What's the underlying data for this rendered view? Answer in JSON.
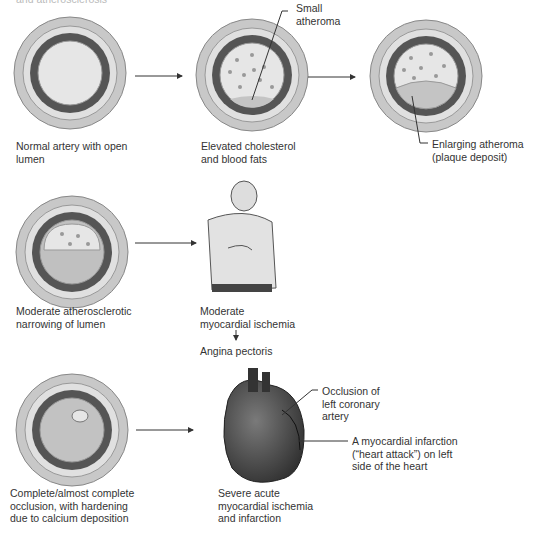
{
  "top_cutoff_text": "and atherosclerosis",
  "stages": [
    {
      "id": "normal",
      "caption": [
        "Normal artery with open",
        "lumen"
      ]
    },
    {
      "id": "elevated",
      "caption": [
        "Elevated cholesterol",
        "and blood fats"
      ],
      "callout": [
        "Small",
        "atheroma"
      ]
    },
    {
      "id": "enlarging",
      "caption": [
        "Enlarging atheroma",
        "(plaque deposit)"
      ]
    },
    {
      "id": "moderate",
      "caption": [
        "Moderate atherosclerotic",
        "narrowing of lumen"
      ]
    },
    {
      "id": "ischemia",
      "caption": [
        "Moderate",
        "myocardial ischemia"
      ],
      "result": "Angina pectoris"
    },
    {
      "id": "complete",
      "caption": [
        "Complete/almost complete",
        "occlusion, with hardening",
        "due to calcium deposition"
      ]
    },
    {
      "id": "infarction",
      "caption": [
        "Severe acute",
        "myocardial ischemia",
        "and infarction"
      ],
      "callout_occlusion": [
        "Occlusion of",
        "left coronary",
        "artery"
      ],
      "callout_mi": [
        "A myocardial infarction",
        "(“heart attack”) on left",
        "side of the heart"
      ]
    }
  ],
  "colors": {
    "outer": "#cfcfcf",
    "media": "#555555",
    "lumen": "#dadada",
    "plaque": "#bdbdbd",
    "dot": "#8a8a8a",
    "heart": "#4a4a4a"
  }
}
